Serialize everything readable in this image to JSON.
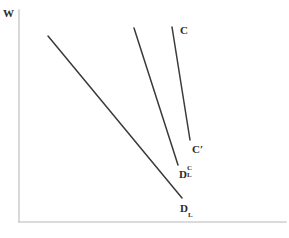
{
  "figure": {
    "background_color": "#ffffff",
    "axis_color": "#cfcfcf",
    "curve_color": "#3a3a3a"
  },
  "axes": {
    "y_axis_label": "W",
    "x_axis_label": "",
    "y_axis": {
      "x": 19,
      "y_top": 10,
      "y_bottom": 222
    },
    "x_axis": {
      "y": 222,
      "x_left": 19,
      "x_right": 286
    }
  },
  "labels": {
    "w": "W",
    "c": "C",
    "c_prime": "C′",
    "dlc_base": "D",
    "dlc_sup": "C",
    "dlc_sub": "L",
    "dl_base": "D",
    "dl_sub": "L"
  },
  "chart_data": {
    "type": "line",
    "xlabel": "",
    "ylabel": "W",
    "grid": false,
    "legend": "none",
    "xlim": [
      19,
      286
    ],
    "ylim": [
      222,
      10
    ],
    "axis_direction": "y up, x right",
    "series": [
      {
        "name": "D_L",
        "label": "D_L",
        "label_text": "DL",
        "x": [
          48,
          182
        ],
        "y": [
          36,
          198
        ],
        "endpoints": [
          [
            48,
            36
          ],
          [
            182,
            198
          ]
        ],
        "description": "leftmost, shallowest downward-sloping line (labor demand)"
      },
      {
        "name": "D_L^C",
        "label": "D_L^C",
        "label_text": "DLC",
        "x": [
          134,
          178
        ],
        "y": [
          28,
          165
        ],
        "endpoints": [
          [
            134,
            28
          ],
          [
            178,
            165
          ]
        ],
        "description": "middle, steep downward-sloping line (compensated labor demand)"
      },
      {
        "name": "C",
        "label": "C to C'",
        "label_text": "C",
        "x": [
          172,
          190
        ],
        "y": [
          27,
          140
        ],
        "endpoints": [
          [
            172,
            27
          ],
          [
            190,
            140
          ]
        ],
        "description": "rightmost, steepest line running from C at top to C-prime at bottom"
      }
    ],
    "annotations": [
      {
        "text": "W",
        "x": 3,
        "y": 4,
        "anchor": "y-axis-top"
      },
      {
        "text": "C",
        "x": 180,
        "y": 21,
        "anchor": "top of steepest line"
      },
      {
        "text": "C′",
        "x": 192,
        "y": 140,
        "anchor": "bottom of steepest line"
      },
      {
        "text": "D_L^C",
        "x": 179,
        "y": 165,
        "anchor": "bottom of middle line"
      },
      {
        "text": "D_L",
        "x": 180,
        "y": 199,
        "anchor": "bottom of leftmost line"
      }
    ]
  }
}
